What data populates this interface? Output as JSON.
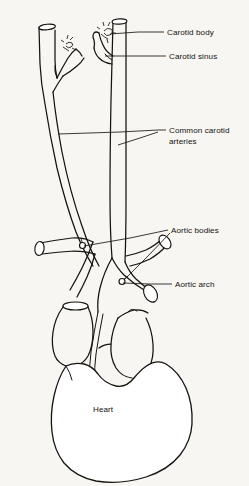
{
  "figure": {
    "style": "hand-drawn anatomical line drawing",
    "background_color": "#f7f6f3",
    "ink_color": "#16130f"
  },
  "labels": {
    "carotid_body": "Carotid body",
    "carotid_sinus": "Carotid sinus",
    "common_carotid_line1": "Common carotid",
    "common_carotid_line2": "arteries",
    "aortic_bodies": "Aortic bodies",
    "aortic_arch": "Aortic arch",
    "heart": "Heart"
  },
  "structures": [
    {
      "name": "left-common-carotid-artery",
      "label_ref": "common_carotid_line1"
    },
    {
      "name": "right-common-carotid-artery",
      "label_ref": "common_carotid_line1"
    },
    {
      "name": "left-carotid-bifurcation",
      "label_ref": "carotid_sinus"
    },
    {
      "name": "right-carotid-bifurcation",
      "label_ref": "carotid_sinus"
    },
    {
      "name": "left-carotid-body-nerve-plexus",
      "label_ref": "carotid_body"
    },
    {
      "name": "right-carotid-body-nerve-plexus",
      "label_ref": "carotid_body"
    },
    {
      "name": "aortic-arch-vessel",
      "label_ref": "aortic_arch"
    },
    {
      "name": "aortic-body-nodule-left",
      "label_ref": "aortic_bodies"
    },
    {
      "name": "aortic-body-nodule-right",
      "label_ref": "aortic_bodies"
    },
    {
      "name": "subclavian-artery-stump",
      "label_ref": null
    },
    {
      "name": "brachiocephalic-trunk",
      "label_ref": null
    },
    {
      "name": "superior-vena-cava",
      "label_ref": null
    },
    {
      "name": "pulmonary-trunk",
      "label_ref": null
    },
    {
      "name": "heart-outline",
      "label_ref": "heart"
    }
  ],
  "leader_lines": [
    {
      "name": "leader-carotid-body",
      "to": "right-carotid-body-nerve-plexus"
    },
    {
      "name": "leader-carotid-sinus",
      "to": "right-carotid-bifurcation"
    },
    {
      "name": "leader-common-carotid-left",
      "to": "left-common-carotid-artery"
    },
    {
      "name": "leader-common-carotid-right",
      "to": "right-common-carotid-artery"
    },
    {
      "name": "leader-aortic-bodies-left",
      "to": "aortic-body-nodule-left"
    },
    {
      "name": "leader-aortic-bodies-right",
      "to": "aortic-body-nodule-right"
    },
    {
      "name": "leader-aortic-arch",
      "to": "aortic-arch-vessel"
    }
  ]
}
